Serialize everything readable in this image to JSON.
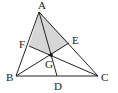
{
  "diagram": {
    "type": "triangle-with-cevians",
    "shaded_region": [
      "A",
      "F",
      "G",
      "E"
    ],
    "shade_color": "#d6d6d6",
    "line_color": "#222222",
    "points": {
      "A": {
        "label": "A",
        "x": 39,
        "y": 12,
        "lx": 38,
        "ly": 9
      },
      "B": {
        "label": "B",
        "x": 16,
        "y": 76,
        "lx": 6,
        "ly": 81
      },
      "C": {
        "label": "C",
        "x": 98,
        "y": 76,
        "lx": 101,
        "ly": 81
      },
      "D": {
        "label": "D",
        "x": 57,
        "y": 76,
        "lx": 54,
        "ly": 90
      },
      "E": {
        "label": "E",
        "x": 69,
        "y": 43,
        "lx": 72,
        "ly": 44
      },
      "F": {
        "label": "F",
        "x": 29,
        "y": 46,
        "lx": 19,
        "ly": 48
      },
      "G": {
        "label": "G",
        "x": 51,
        "y": 55,
        "lx": 45,
        "ly": 68
      }
    },
    "segments": [
      [
        "A",
        "B"
      ],
      [
        "B",
        "C"
      ],
      [
        "C",
        "A"
      ],
      [
        "A",
        "D"
      ],
      [
        "B",
        "E"
      ],
      [
        "C",
        "F"
      ]
    ]
  }
}
